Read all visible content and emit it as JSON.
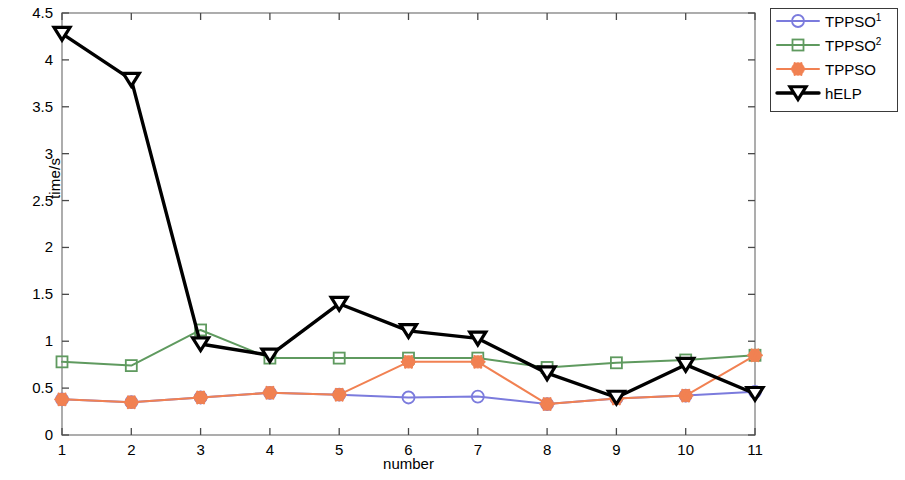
{
  "chart_data": {
    "type": "line",
    "title": "",
    "xlabel": "number",
    "ylabel": "time/s",
    "x": [
      1,
      2,
      3,
      4,
      5,
      6,
      7,
      8,
      9,
      10,
      11
    ],
    "xlim": [
      1,
      11
    ],
    "ylim": [
      0,
      4.5
    ],
    "xticks": [
      "1",
      "2",
      "3",
      "4",
      "5",
      "6",
      "7",
      "8",
      "9",
      "10",
      "11"
    ],
    "yticks": [
      "0",
      "0.5",
      "1",
      "1.5",
      "2",
      "2.5",
      "3",
      "3.5",
      "4",
      "4.5"
    ],
    "grid": false,
    "legend_position": "outside-top-right",
    "series": [
      {
        "name": "TPPSO1",
        "label": "TPPSO",
        "superscript": "1",
        "color": "#7b7bdd",
        "marker": "circle",
        "values": [
          0.38,
          0.35,
          0.4,
          0.45,
          0.43,
          0.4,
          0.41,
          0.33,
          0.39,
          0.42,
          0.46
        ]
      },
      {
        "name": "TPPSO2",
        "label": "TPPSO",
        "superscript": "2",
        "color": "#5f9a5f",
        "marker": "square",
        "values": [
          0.78,
          0.74,
          1.12,
          0.82,
          0.82,
          0.82,
          0.82,
          0.72,
          0.77,
          0.8,
          0.85
        ]
      },
      {
        "name": "TPPSO",
        "label": "TPPSO",
        "superscript": "",
        "color": "#f18152",
        "marker": "star",
        "values": [
          0.38,
          0.35,
          0.4,
          0.45,
          0.43,
          0.78,
          0.78,
          0.33,
          0.39,
          0.42,
          0.85
        ]
      },
      {
        "name": "hELP",
        "label": "hELP",
        "superscript": "",
        "color": "#000000",
        "marker": "triangle-down",
        "values": [
          4.28,
          3.79,
          0.97,
          0.85,
          1.4,
          1.11,
          1.03,
          0.66,
          0.4,
          0.75,
          0.44
        ]
      }
    ]
  },
  "legend": {
    "entries": [
      {
        "label": "TPPSO",
        "superscript": "1"
      },
      {
        "label": "TPPSO",
        "superscript": "2"
      },
      {
        "label": "TPPSO",
        "superscript": ""
      },
      {
        "label": "hELP",
        "superscript": ""
      }
    ]
  },
  "axes": {
    "x_axis_label": "number",
    "y_axis_label": "time/s"
  }
}
